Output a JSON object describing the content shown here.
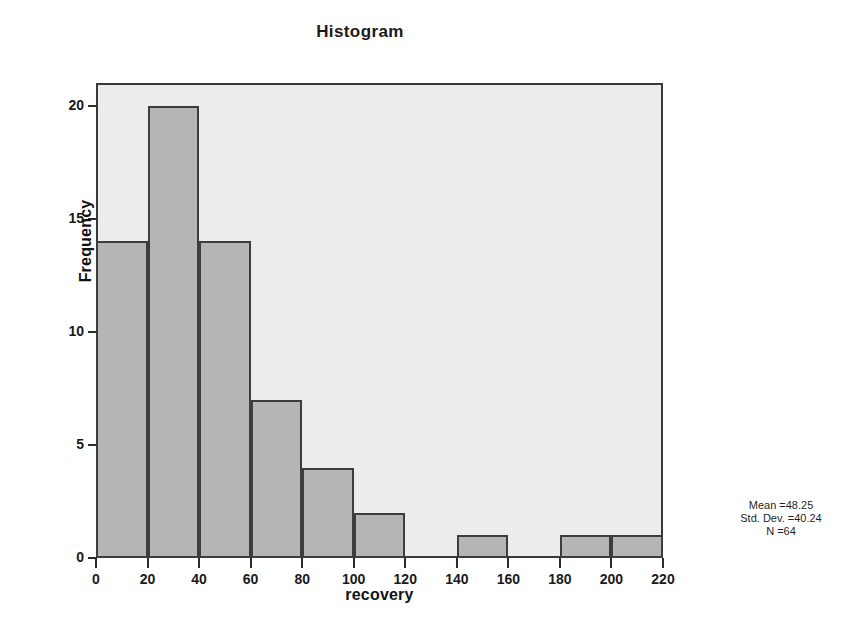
{
  "chart_data": {
    "type": "bar",
    "title": "Histogram",
    "xlabel": "recovery",
    "ylabel": "Frequency",
    "bin_width": 20,
    "categories": [
      "0-20",
      "20-40",
      "40-60",
      "60-80",
      "80-100",
      "100-120",
      "120-140",
      "140-160",
      "160-180",
      "180-200",
      "200-220"
    ],
    "bin_starts": [
      0,
      20,
      40,
      60,
      80,
      100,
      120,
      140,
      160,
      180,
      200
    ],
    "values": [
      14,
      20,
      14,
      7,
      4,
      2,
      0,
      1,
      0,
      1,
      1
    ],
    "xlim": [
      0,
      220
    ],
    "ylim": [
      0,
      21
    ],
    "xticks": [
      0,
      20,
      40,
      60,
      80,
      100,
      120,
      140,
      160,
      180,
      200,
      220
    ],
    "yticks": [
      0,
      5,
      10,
      15,
      20
    ],
    "xtick_labels": [
      "0",
      "20",
      "40",
      "60",
      "80",
      "100",
      "120",
      "140",
      "160",
      "180",
      "200",
      "220"
    ],
    "ytick_labels": [
      "0",
      "5",
      "10",
      "15",
      "20"
    ],
    "grid": false,
    "legend": null,
    "annotations": {
      "mean": "Mean =48.25",
      "std_dev": "Std. Dev. =40.24",
      "n": "N =64"
    },
    "colors": {
      "bar_fill": "#b5b5b5",
      "bar_edge": "#3d3d3d",
      "plot_background": "#efefef",
      "frame": "#3a3a3a",
      "text": "#1a1a1a",
      "page_background": "#ffffff"
    }
  }
}
